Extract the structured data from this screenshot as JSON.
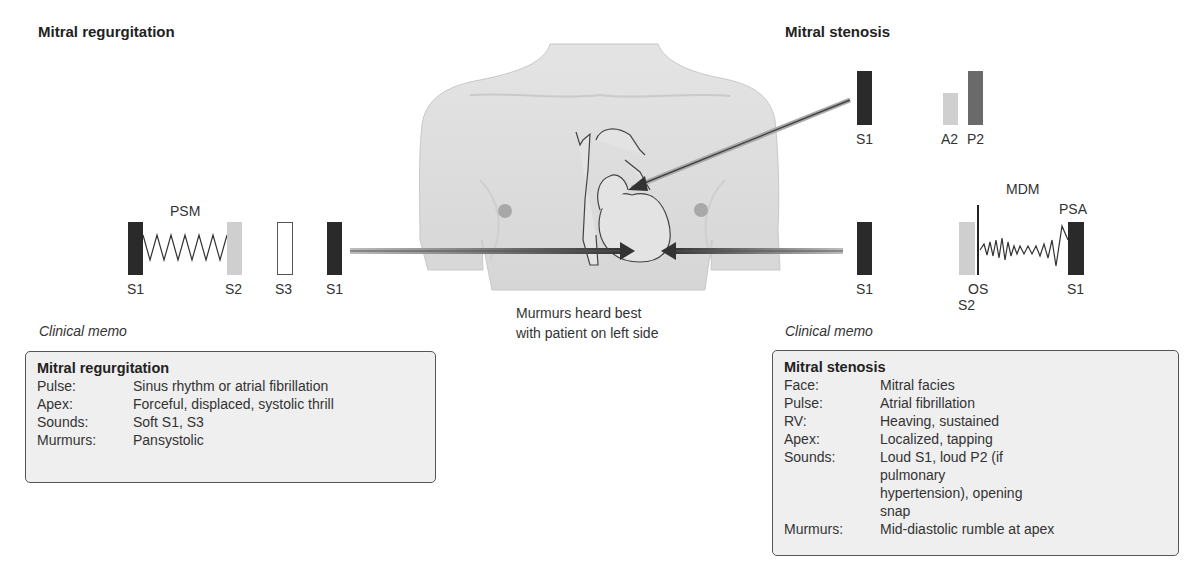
{
  "left": {
    "title": "Mitral regurgitation",
    "murmur_label": "PSM",
    "sounds": [
      {
        "label": "S1",
        "style": "dark"
      },
      {
        "label": "S2",
        "style": "light"
      },
      {
        "label": "S3",
        "style": "hollow"
      },
      {
        "label": "S1",
        "style": "dark"
      }
    ],
    "memo_heading": "Clinical memo",
    "memo": {
      "title": "Mitral regurgitation",
      "rows": [
        {
          "key": "Pulse:",
          "value": "Sinus rhythm or atrial fibrillation"
        },
        {
          "key": "Apex:",
          "value": "Forceful, displaced, systolic thrill"
        },
        {
          "key": "Sounds:",
          "value": "Soft S1, S3"
        },
        {
          "key": "Murmurs:",
          "value": "Pansystolic"
        }
      ]
    }
  },
  "center": {
    "caption_line1": "Murmurs heard best",
    "caption_line2": "with patient on left side"
  },
  "right": {
    "title": "Mitral stenosis",
    "top_sounds": [
      {
        "label": "S1",
        "style": "dark"
      },
      {
        "label": "A2",
        "style": "light"
      },
      {
        "label": "P2",
        "style": "mid"
      }
    ],
    "bottom_sounds": [
      {
        "label": "S1",
        "style": "dark"
      },
      {
        "label": "OS"
      },
      {
        "label": "S2",
        "style": "light"
      },
      {
        "label": "S1",
        "style": "dark"
      }
    ],
    "murmur_label": "MDM",
    "presystolic_label": "PSA",
    "memo_heading": "Clinical memo",
    "memo": {
      "title": "Mitral stenosis",
      "rows": [
        {
          "key": "Face:",
          "value": "Mitral facies"
        },
        {
          "key": "Pulse:",
          "value": "Atrial fibrillation"
        },
        {
          "key": "RV:",
          "value": "Heaving, sustained"
        },
        {
          "key": "Apex:",
          "value": "Localized, tapping"
        },
        {
          "key": "Sounds:",
          "value": "Loud S1, loud P2 (if pulmonary hypertension), opening snap"
        },
        {
          "key": "Murmurs:",
          "value": "Mid-diastolic rumble at apex"
        }
      ]
    }
  },
  "colors": {
    "dark_bar": "#2a2a2a",
    "light_bar": "#cfcfcf",
    "mid_bar": "#6a6a6a",
    "memo_bg": "#efefef",
    "skin": "#dcdcdc"
  }
}
